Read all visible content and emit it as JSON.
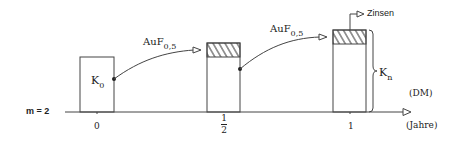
{
  "diagram": {
    "m_label": "m = 2",
    "unit_label": "(DM)",
    "axis_label": "(Jahre)",
    "ticks": [
      {
        "label": "0"
      },
      {
        "num": "1",
        "den": "2"
      },
      {
        "label": "1"
      }
    ],
    "boxes": [
      {
        "label_main": "K",
        "label_sub": "0"
      },
      {
        "label_main": "",
        "label_sub": ""
      },
      {
        "label_main": "K",
        "label_sub": "n"
      }
    ],
    "arrows": [
      {
        "label_main": "AuF",
        "label_sub": "0,5"
      },
      {
        "label_main": "AuF",
        "label_sub": "0,5"
      }
    ],
    "interest_label": "Zinsen",
    "colors": {
      "line": "#333333",
      "background": "#ffffff"
    }
  }
}
